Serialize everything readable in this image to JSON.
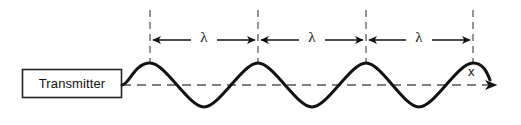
{
  "figure": {
    "kind": "wavelength-diagram",
    "background_color": "#ffffff",
    "stroke_color": "#111111",
    "dash_color": "#6b6b6b"
  },
  "transmitter": {
    "label": "Transmitter",
    "box": {
      "x": 22,
      "y": 69,
      "width": 100,
      "height": 29
    },
    "border_color": "#222222",
    "fill_color": "#ffffff"
  },
  "axis": {
    "label": "x",
    "baseline_y": 85,
    "start_x": 122,
    "end_x": 512,
    "style": "dashed-with-arrowhead"
  },
  "wave": {
    "start_x": 122,
    "baseline_y": 85,
    "amplitude": 22,
    "wavelength": 108,
    "cycles": 3.6,
    "color": "#111111",
    "line_width": 3
  },
  "markers": {
    "dashed_vertical_x": [
      150,
      258,
      366,
      473
    ],
    "dashed_top_y": 10,
    "dashed_bottom_y": 64
  },
  "measurements": [
    {
      "label": "λ",
      "from_x": 150,
      "to_x": 258,
      "y": 40,
      "center_x": 204
    },
    {
      "label": "λ",
      "from_x": 258,
      "to_x": 366,
      "y": 40,
      "center_x": 312
    },
    {
      "label": "λ",
      "from_x": 366,
      "to_x": 473,
      "y": 40,
      "center_x": 419
    }
  ]
}
